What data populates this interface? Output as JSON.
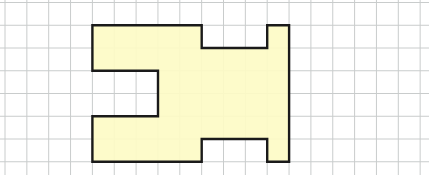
{
  "figure": {
    "background_color": "#ffffff",
    "grid": {
      "line_color": "#c9cccc",
      "origin_x": 5,
      "origin_y": 2.5,
      "cell_w": 21.85,
      "cell_h": 22.75,
      "cols": 20,
      "rows": 8
    },
    "shape": {
      "fill_color": "#fdfbc6",
      "stroke_color": "#1a1a1a",
      "stroke_width": 2.4,
      "grid_offset_col": 4,
      "grid_offset_row": 1,
      "vertices": [
        [
          0,
          0
        ],
        [
          5,
          0
        ],
        [
          5,
          1
        ],
        [
          8,
          1
        ],
        [
          8,
          0
        ],
        [
          9,
          0
        ],
        [
          9,
          6
        ],
        [
          8,
          6
        ],
        [
          8,
          5
        ],
        [
          5,
          5
        ],
        [
          5,
          6
        ],
        [
          0,
          6
        ],
        [
          0,
          4
        ],
        [
          3,
          4
        ],
        [
          3,
          2
        ],
        [
          0,
          2
        ]
      ]
    }
  }
}
